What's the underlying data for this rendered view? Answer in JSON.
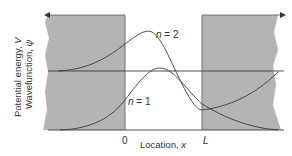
{
  "figure": {
    "y_axis_label_line1": "Potential energy, V",
    "y_axis_label_line2": "Wavefunction, ψ",
    "y_axis_label_line1_text": "Potential energy, ",
    "y_axis_label_line1_var": "V",
    "y_axis_label_line2_text": "Wavefunction, ",
    "y_axis_label_line2_var": "ψ",
    "x_axis_label_text": "Location, ",
    "x_axis_label_var": "x",
    "tick_zero": "0",
    "tick_L": "L",
    "curve_labels": [
      {
        "n_var": "n",
        "text": " = 2"
      },
      {
        "n_var": "n",
        "text": " = 1"
      }
    ]
  },
  "colors": {
    "barrier_fill": "#b4b4b4",
    "line": "#3a3a3a",
    "text": "#333333",
    "background": "#ffffff"
  }
}
